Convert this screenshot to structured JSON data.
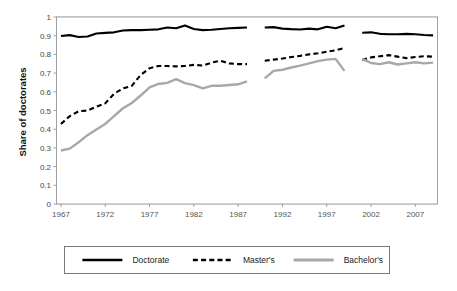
{
  "chart_data": {
    "type": "line",
    "title": "",
    "xlabel": "",
    "ylabel": "Share of doctorates",
    "ylim": [
      0,
      1
    ],
    "xlim": [
      1967,
      2009
    ],
    "grid": true,
    "legend_position": "bottom",
    "y_ticks": [
      "0",
      "0.1",
      "0.2",
      "0.3",
      "0.4",
      "0.5",
      "0.6",
      "0.7",
      "0.8",
      "0.9",
      "1"
    ],
    "y_tick_values": [
      0,
      0.1,
      0.2,
      0.3,
      0.4,
      0.5,
      0.6,
      0.7,
      0.8,
      0.9,
      1
    ],
    "x_ticks": [
      "1967",
      "1972",
      "1977",
      "1982",
      "1987",
      "1992",
      "1997",
      "2002",
      "2007"
    ],
    "x_tick_values": [
      1967,
      1972,
      1977,
      1982,
      1987,
      1992,
      1997,
      2002,
      2007
    ],
    "series": [
      {
        "name": "Doctorate",
        "color": "#000000",
        "style": "solid",
        "width": 2.1,
        "segments": [
          {
            "x": [
              1967,
              1968,
              1969,
              1970,
              1971,
              1972,
              1973,
              1974,
              1975,
              1976,
              1977,
              1978,
              1979,
              1980,
              1981,
              1982,
              1983,
              1984,
              1985,
              1986,
              1987,
              1988
            ],
            "values": [
              0.898,
              0.903,
              0.893,
              0.896,
              0.912,
              0.915,
              0.918,
              0.928,
              0.93,
              0.93,
              0.932,
              0.934,
              0.944,
              0.94,
              0.955,
              0.936,
              0.93,
              0.932,
              0.936,
              0.94,
              0.942,
              0.944
            ]
          },
          {
            "x": [
              1990,
              1991,
              1992,
              1993,
              1994,
              1995,
              1996,
              1997,
              1998,
              1999
            ],
            "values": [
              0.944,
              0.946,
              0.938,
              0.935,
              0.933,
              0.938,
              0.934,
              0.948,
              0.94,
              0.954
            ]
          },
          {
            "x": [
              2001,
              2002,
              2003,
              2004,
              2005,
              2006,
              2007,
              2008,
              2009
            ],
            "values": [
              0.916,
              0.918,
              0.91,
              0.908,
              0.908,
              0.91,
              0.908,
              0.904,
              0.902
            ]
          }
        ]
      },
      {
        "name": "Master's",
        "color": "#000000",
        "style": "dashed",
        "width": 2.1,
        "dash": "5,3.2",
        "segments": [
          {
            "x": [
              1967,
              1968,
              1969,
              1970,
              1971,
              1972,
              1973,
              1974,
              1975,
              1976,
              1977,
              1978,
              1979,
              1980,
              1981,
              1982,
              1983,
              1984,
              1985,
              1986,
              1987,
              1988
            ],
            "values": [
              0.428,
              0.47,
              0.496,
              0.5,
              0.52,
              0.538,
              0.59,
              0.618,
              0.632,
              0.69,
              0.726,
              0.738,
              0.738,
              0.736,
              0.738,
              0.744,
              0.74,
              0.756,
              0.766,
              0.752,
              0.748,
              0.748
            ]
          },
          {
            "x": [
              1990,
              1991,
              1992,
              1993,
              1994,
              1995,
              1996,
              1997,
              1998,
              1999
            ],
            "values": [
              0.766,
              0.772,
              0.778,
              0.786,
              0.792,
              0.8,
              0.806,
              0.814,
              0.822,
              0.834
            ]
          },
          {
            "x": [
              2001,
              2002,
              2003,
              2004,
              2005,
              2006,
              2007,
              2008,
              2009
            ],
            "values": [
              0.77,
              0.784,
              0.79,
              0.796,
              0.788,
              0.78,
              0.786,
              0.79,
              0.788
            ]
          }
        ]
      },
      {
        "name": "Bachelor's",
        "color": "#a8a8a8",
        "style": "solid",
        "width": 2.4,
        "segments": [
          {
            "x": [
              1967,
              1968,
              1969,
              1970,
              1971,
              1972,
              1973,
              1974,
              1975,
              1976,
              1977,
              1978,
              1979,
              1980,
              1981,
              1982,
              1983,
              1984,
              1985,
              1986,
              1987,
              1988
            ],
            "values": [
              0.286,
              0.296,
              0.33,
              0.368,
              0.398,
              0.428,
              0.47,
              0.512,
              0.54,
              0.58,
              0.624,
              0.642,
              0.648,
              0.668,
              0.646,
              0.636,
              0.618,
              0.632,
              0.632,
              0.636,
              0.64,
              0.656
            ]
          },
          {
            "x": [
              1990,
              1991,
              1992,
              1993,
              1994,
              1995,
              1996,
              1997,
              1998,
              1999
            ],
            "values": [
              0.672,
              0.712,
              0.718,
              0.73,
              0.74,
              0.752,
              0.764,
              0.772,
              0.776,
              0.712
            ]
          },
          {
            "x": [
              2001,
              2002,
              2003,
              2004,
              2005,
              2006,
              2007,
              2008,
              2009
            ],
            "values": [
              0.776,
              0.754,
              0.748,
              0.758,
              0.746,
              0.752,
              0.758,
              0.752,
              0.756
            ]
          }
        ]
      }
    ]
  },
  "legend": {
    "items": [
      {
        "label": "Doctorate",
        "color": "#000000",
        "style": "solid"
      },
      {
        "label": "Master's",
        "color": "#000000",
        "style": "dashed"
      },
      {
        "label": "Bachelor's",
        "color": "#a8a8a8",
        "style": "solid"
      }
    ]
  }
}
